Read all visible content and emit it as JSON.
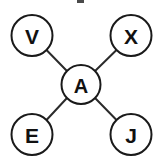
{
  "diagram": {
    "type": "star-graph",
    "title": "",
    "background_color": "#ffffff",
    "node_fill": "#ffffff",
    "node_stroke": "#1a1a1a",
    "edge_color": "#2b2b2b",
    "label_color": "#111111",
    "center_node": {
      "id": "A",
      "label": "A",
      "cx": 81,
      "cy": 84.5,
      "r": 19.5
    },
    "outer_nodes": [
      {
        "id": "V",
        "label": "V",
        "cx": 32,
        "cy": 35.5,
        "r": 20.5,
        "position": "top-left"
      },
      {
        "id": "X",
        "label": "X",
        "cx": 131,
        "cy": 35.5,
        "r": 20.5,
        "position": "top-right"
      },
      {
        "id": "E",
        "label": "E",
        "cx": 32,
        "cy": 134.5,
        "r": 20.5,
        "position": "bottom-left"
      },
      {
        "id": "J",
        "label": "J",
        "cx": 131,
        "cy": 134.5,
        "r": 20.5,
        "position": "bottom-right"
      }
    ],
    "edges": [
      {
        "id": "edge-a-v",
        "from": "A",
        "to": "V",
        "x1": 67.2,
        "y1": 71.3,
        "x2": 46.5,
        "y2": 50.0
      },
      {
        "id": "edge-a-x",
        "from": "A",
        "to": "X",
        "x1": 94.8,
        "y1": 71.3,
        "x2": 116.5,
        "y2": 50.0
      },
      {
        "id": "edge-a-e",
        "from": "A",
        "to": "E",
        "x1": 67.2,
        "y1": 97.7,
        "x2": 46.5,
        "y2": 120.0
      },
      {
        "id": "edge-a-j",
        "from": "A",
        "to": "J",
        "x1": 94.8,
        "y1": 97.7,
        "x2": 116.5,
        "y2": 120.0
      }
    ],
    "artifact": {
      "id": "top-edge-artifact",
      "x": 77,
      "y": 0,
      "width": 7,
      "height": 3,
      "color": "#4a4a4a"
    }
  }
}
